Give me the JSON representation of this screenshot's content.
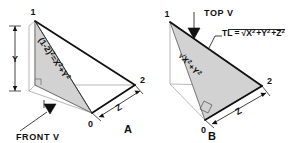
{
  "figure": {
    "title_implicit": "True length of a line by right-triangle construction",
    "background_color": "#ffffff",
    "line_color": "#101010",
    "thin_line_color": "#8a8a8a",
    "fill_color": "#d4d4d4"
  },
  "panel_a": {
    "label": "A",
    "vertices": {
      "top": "1",
      "right": "2",
      "origin": "0"
    },
    "dimensions": {
      "vertical": "Y",
      "depth": "Z"
    },
    "view_label": "FRONT V",
    "formula": {
      "full": "(1-2)² = X² + Y²",
      "lhs_base": "(1-2)",
      "lhs_exp": "2",
      "equals": "=",
      "term1_base": "X",
      "term1_exp": "2",
      "plus": "+",
      "term2_base": "Y",
      "term2_exp": "2"
    }
  },
  "panel_b": {
    "label": "B",
    "vertices": {
      "top": "1",
      "right": "2",
      "origin": "0"
    },
    "dimensions": {
      "depth": "Z"
    },
    "view_label": "TOP V",
    "tl_formula": {
      "full": "TL = √(X² + Y² + Z²)",
      "prefix": "TL =",
      "t1_base": "X",
      "t1_exp": "2",
      "plus1": "+",
      "t2_base": "Y",
      "t2_exp": "2",
      "plus2": "+",
      "t3_base": "Z",
      "t3_exp": "2"
    },
    "diagonal_formula": {
      "full": "√(X² + Y²)",
      "t1_base": "X",
      "t1_exp": "2",
      "plus": "+",
      "t2_base": "Y",
      "t2_exp": "2"
    }
  }
}
